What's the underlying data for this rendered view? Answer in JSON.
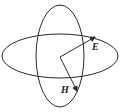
{
  "diagram": {
    "stroke_color": "#2a2a2a",
    "background": "#ffffff",
    "ellipses": [
      {
        "name": "horizontal-ellipse",
        "cx": 60,
        "cy": 56,
        "rx": 58,
        "ry": 22
      },
      {
        "name": "vertical-ellipse",
        "cx": 60,
        "cy": 56,
        "rx": 24,
        "ry": 51
      }
    ],
    "origin": {
      "x": 60,
      "y": 57
    },
    "vectors": [
      {
        "name": "E",
        "label": "E",
        "tip": {
          "x": 95,
          "y": 37
        },
        "label_pos": {
          "x": 93,
          "y": 50
        }
      },
      {
        "name": "H",
        "label": "H",
        "tip": {
          "x": 77,
          "y": 91
        },
        "label_pos": {
          "x": 62,
          "y": 93
        }
      }
    ]
  }
}
